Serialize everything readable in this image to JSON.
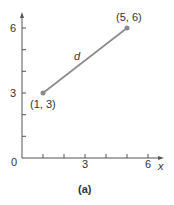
{
  "diagram": {
    "caption": "(a)",
    "axes": {
      "x_label": "x",
      "origin_label": "0",
      "x_tick_labels": [
        "3",
        "6"
      ],
      "y_tick_labels": [
        "3",
        "6"
      ],
      "x_ticks": [
        1,
        2,
        3,
        4,
        5,
        6
      ],
      "y_ticks": [
        1,
        2,
        3,
        4,
        5,
        6
      ]
    },
    "segment": {
      "label": "d",
      "color": "#8a8a8a",
      "start": {
        "x": 1,
        "y": 3,
        "label": "(1, 3)"
      },
      "end": {
        "x": 5,
        "y": 6,
        "label": "(5, 6)"
      }
    }
  }
}
